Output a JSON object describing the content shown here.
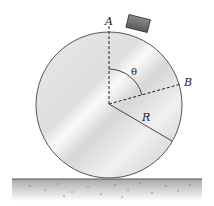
{
  "diagram": {
    "labels": {
      "point_a": "A",
      "point_b": "B",
      "angle": "θ",
      "radius": "R"
    },
    "colors": {
      "disk_outline": "#555555",
      "disk_fill_light": "#f4f4f4",
      "disk_fill_dark": "#c9c9c9",
      "block_fill": "#6e6e6e",
      "ground": "#b9b9b9",
      "line": "#333333"
    }
  }
}
